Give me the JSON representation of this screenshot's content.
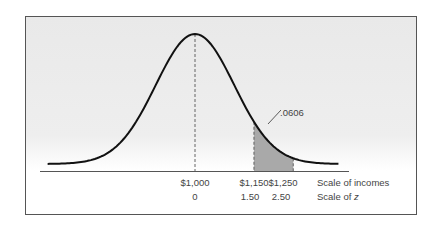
{
  "chart_data": {
    "type": "area",
    "title": "",
    "mean": 1000,
    "sd": 100,
    "shaded_region": {
      "from": 1150,
      "to": 1250,
      "z_from": 1.5,
      "z_to": 2.5,
      "area": 0.0606
    },
    "annotation": ".0606",
    "x_ticks_income": [
      "$1,000",
      "$1,150",
      "$1,250"
    ],
    "x_ticks_z": [
      "0",
      "1.50",
      "2.50"
    ],
    "axis_labels": {
      "income": "Scale of incomes",
      "z_prefix": "Scale of ",
      "z_var": "z"
    },
    "grid": false,
    "colors": {
      "curve": "#111111",
      "shade": "#a9a9a9",
      "dash": "#555555"
    }
  }
}
